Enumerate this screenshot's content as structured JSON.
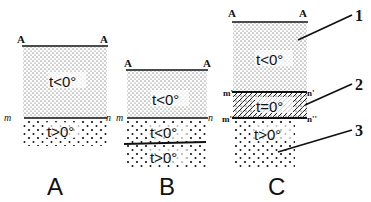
{
  "diagram": {
    "panels": [
      {
        "id": "A",
        "caption": "A",
        "surface_labels": [
          "A",
          "A"
        ],
        "boundary_labels": [
          "m",
          "n"
        ],
        "layers": [
          {
            "label": "t<0°",
            "texture": "dense-dots"
          },
          {
            "label": "t>0°",
            "texture": "sparse-dots"
          }
        ]
      },
      {
        "id": "B",
        "caption": "B",
        "surface_labels": [
          "A",
          "A"
        ],
        "boundary_labels": [
          "m",
          "n"
        ],
        "layers": [
          {
            "label": "t<0°",
            "texture": "dense-dots"
          },
          {
            "label": "t<0°",
            "texture": "sparse-dots"
          },
          {
            "label": "t>0°",
            "texture": "sparse-dots"
          }
        ]
      },
      {
        "id": "C",
        "caption": "C",
        "surface_labels": [
          "A",
          "A"
        ],
        "boundary_labels_upper": [
          "m'",
          "n'"
        ],
        "boundary_labels_lower": [
          "m''",
          "n''"
        ],
        "layers": [
          {
            "label": "t<0°",
            "texture": "dense-dots"
          },
          {
            "label": "t=0°",
            "texture": "hatched"
          },
          {
            "label": "t>0°",
            "texture": "sparse-dots"
          }
        ],
        "callouts": [
          "1",
          "2",
          "3"
        ]
      }
    ]
  }
}
